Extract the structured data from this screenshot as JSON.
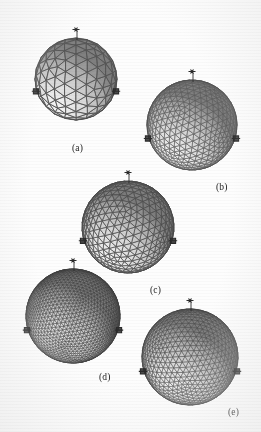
{
  "figure": {
    "background_color": "#fdfdfd",
    "ink_color": "#3a3a3a",
    "render_style": "grayscale shaded wireframe",
    "width": 261,
    "height": 432,
    "panel_count": 5
  },
  "chart_data": {
    "type": "diagram",
    "xlabel": "",
    "ylabel": "",
    "categories": [
      "(a)",
      "(b)",
      "(c)",
      "(d)",
      "(e)"
    ],
    "values": [
      1,
      2,
      3,
      4,
      5
    ],
    "series": [
      {
        "name": "subdivision_frequency",
        "values": [
          4,
          8,
          7,
          14,
          10
        ]
      },
      {
        "name": "approx_triangle_count",
        "values": [
          320,
          1280,
          980,
          3920,
          2000
        ]
      },
      {
        "name": "sphere_pixel_diameter",
        "values": [
          80,
          90,
          92,
          94,
          97
        ]
      }
    ],
    "legend_position": "none",
    "grid": false,
    "annotations": [
      "Each sphere carries a small probe marker at the north pole",
      "Dark anchor markers sit on the left and right equator silhouette",
      "Mesh density increases from coarse (a) to fine (e)"
    ]
  },
  "panels": [
    {
      "id": "a",
      "label": "(a)",
      "caption_x": 78,
      "caption_y": 150,
      "center_x": 76,
      "center_y": 79,
      "radius": 41,
      "frequency": 4,
      "edge_color": "#555555",
      "facet_light": "#f2f2f2",
      "facet_dark": "#9a9a9a",
      "edge_width": 1.0,
      "description": "Coarsest geodesic sphere, large flat triangular facets, strongly faceted silhouette"
    },
    {
      "id": "b",
      "label": "(b)",
      "caption_x": 222,
      "caption_y": 189,
      "center_x": 192,
      "center_y": 125,
      "radius": 45,
      "frequency": 8,
      "edge_color": "#5d5d5d",
      "facet_light": "#efefef",
      "facet_dark": "#a5a5a5",
      "edge_width": 0.7,
      "description": "Medium geodesic sphere with visible great-circle bands and even triangle distribution"
    },
    {
      "id": "c",
      "label": "(c)",
      "caption_x": 156,
      "caption_y": 292,
      "center_x": 128,
      "center_y": 227,
      "radius": 46,
      "frequency": 7,
      "edge_color": "#4c4c4c",
      "facet_light": "#ebebeb",
      "facet_dark": "#8f8f8f",
      "edge_width": 0.8,
      "description": "Medium-fine mesh with banded shading and pronounced latitude rows"
    },
    {
      "id": "d",
      "label": "(d)",
      "caption_x": 105,
      "caption_y": 379,
      "center_x": 73,
      "center_y": 316,
      "radius": 47,
      "frequency": 14,
      "edge_color": "#3b3b3b",
      "facet_light": "#e2e2e2",
      "facet_dark": "#7e7e7e",
      "edge_width": 0.45,
      "description": "Very dense dark triangulation, near-smooth silhouette, irregular sliver triangles"
    },
    {
      "id": "e",
      "label": "(e)",
      "caption_x": 234,
      "caption_y": 414,
      "center_x": 190,
      "center_y": 357,
      "radius": 48,
      "frequency": 10,
      "edge_color": "#4a4a4a",
      "facet_light": "#e8e8e8",
      "facet_dark": "#8a8a8a",
      "edge_width": 0.55,
      "description": "Fine regular geodesic sphere, uniform triangles, smooth round silhouette"
    }
  ],
  "markers": {
    "pole_marker_name": "pole-probe-marker",
    "equator_marker_name": "equator-anchor-marker",
    "marker_color": "#2b2b2b",
    "pole_marker_count_per_sphere": 1,
    "equator_marker_count_per_sphere": 2
  }
}
